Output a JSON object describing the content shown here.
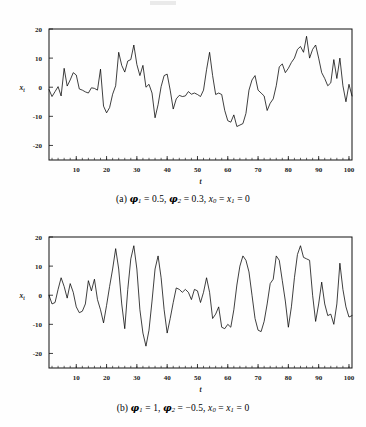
{
  "page": {
    "background_color": "#fefefe",
    "ink_color": "#000000"
  },
  "figures": [
    {
      "id": "a",
      "caption_prefix": "(a)",
      "caption_plain": "(a) φ₁ = 0.5, φ₂ = 0.3, x₀ = x₁ = 0",
      "caption_parts": {
        "label": "(a)",
        "phi1_symbol": "φ",
        "phi1_sub": "1",
        "phi1_eq": "= 0.5,",
        "phi2_symbol": "φ",
        "phi2_sub": "2",
        "phi2_eq": "= 0.3,",
        "x0_symbol": "x",
        "x0_sub": "0",
        "x_eq_mid": "=",
        "x1_symbol": "x",
        "x1_sub": "1",
        "x1_eq": "= 0"
      }
    },
    {
      "id": "b",
      "caption_prefix": "(b)",
      "caption_plain": "(b) φ₁ = 1, φ₂ = −0.5, x₀ = x₁ = 0",
      "caption_parts": {
        "label": "(b)",
        "phi1_symbol": "φ",
        "phi1_sub": "1",
        "phi1_eq": "= 1,",
        "phi2_symbol": "φ",
        "phi2_sub": "2",
        "phi2_eq": "= −0.5,",
        "x0_symbol": "x",
        "x0_sub": "0",
        "x_eq_mid": "=",
        "x1_symbol": "x",
        "x1_sub": "1",
        "x1_eq": "= 0"
      }
    }
  ],
  "chart_data": [
    {
      "type": "line",
      "id": "chart-a",
      "title": "",
      "xlabel": "t",
      "ylabel": "x_t",
      "ylabel_base": "x",
      "ylabel_sub": "t",
      "xlim": [
        1,
        101
      ],
      "ylim": [
        -25,
        20
      ],
      "yticks": [
        20,
        10,
        0,
        -10,
        -20
      ],
      "ytick_labels": [
        "20",
        "10",
        "0",
        "-10",
        "-20"
      ],
      "xticks": [
        10,
        20,
        30,
        40,
        50,
        60,
        70,
        80,
        90,
        100
      ],
      "xtick_labels": [
        "10",
        "20",
        "30",
        "40",
        "50",
        "60",
        "70",
        "80",
        "90",
        "100"
      ],
      "grid": false,
      "legend": "none",
      "line_color": "#000000",
      "x": [
        1,
        2,
        3,
        4,
        5,
        6,
        7,
        8,
        9,
        10,
        11,
        12,
        13,
        14,
        15,
        16,
        17,
        18,
        19,
        20,
        21,
        22,
        23,
        24,
        25,
        26,
        27,
        28,
        29,
        30,
        31,
        32,
        33,
        34,
        35,
        36,
        37,
        38,
        39,
        40,
        41,
        42,
        43,
        44,
        45,
        46,
        47,
        48,
        49,
        50,
        51,
        52,
        53,
        54,
        55,
        56,
        57,
        58,
        59,
        60,
        61,
        62,
        63,
        64,
        65,
        66,
        67,
        68,
        69,
        70,
        71,
        72,
        73,
        74,
        75,
        76,
        77,
        78,
        79,
        80,
        81,
        82,
        83,
        84,
        85,
        86,
        87,
        88,
        89,
        90,
        91,
        92,
        93,
        94,
        95,
        96,
        97,
        98,
        99,
        100,
        101
      ],
      "values": [
        -0.8,
        -3.2,
        -1.5,
        0.2,
        -3.0,
        6.5,
        0.4,
        2.5,
        5.0,
        4.2,
        -0.6,
        -1.0,
        -1.6,
        -2.0,
        -0.2,
        -0.4,
        -1.0,
        6.2,
        -6.5,
        -8.8,
        -7.0,
        -2.4,
        0.5,
        12.0,
        7.5,
        5.2,
        9.0,
        9.5,
        14.5,
        7.8,
        4.0,
        7.5,
        0.0,
        1.0,
        -2.0,
        -10.5,
        -6.0,
        0.2,
        4.0,
        4.5,
        -1.0,
        -7.5,
        -4.0,
        -2.8,
        -3.2,
        -3.0,
        -1.5,
        -2.4,
        -2.0,
        -2.5,
        -3.2,
        -1.0,
        6.0,
        12.0,
        4.0,
        -2.5,
        -2.0,
        -2.5,
        -8.0,
        -11.5,
        -12.0,
        -9.5,
        -13.5,
        -13.0,
        -12.5,
        -9.0,
        -1.0,
        2.5,
        4.0,
        -1.0,
        -2.0,
        -3.0,
        -8.0,
        -5.5,
        -4.0,
        0.5,
        7.0,
        8.0,
        5.0,
        6.5,
        8.5,
        10.0,
        13.0,
        14.0,
        12.0,
        17.5,
        10.0,
        13.0,
        14.5,
        10.0,
        5.0,
        3.0,
        0.5,
        1.5,
        9.5,
        3.0,
        10.0,
        0.5,
        -5.0,
        1.0,
        -3.0
      ]
    },
    {
      "type": "line",
      "id": "chart-b",
      "title": "",
      "xlabel": "t",
      "ylabel": "x_t",
      "ylabel_base": "x",
      "ylabel_sub": "t",
      "xlim": [
        1,
        101
      ],
      "ylim": [
        -25,
        20
      ],
      "yticks": [
        20,
        10,
        0,
        -10,
        -20
      ],
      "ytick_labels": [
        "20",
        "10",
        "0",
        "-10",
        "-20"
      ],
      "xticks": [
        10,
        20,
        30,
        40,
        50,
        60,
        70,
        80,
        90,
        100
      ],
      "xtick_labels": [
        "10",
        "20",
        "30",
        "40",
        "50",
        "60",
        "70",
        "80",
        "90",
        "100"
      ],
      "grid": false,
      "legend": "none",
      "line_color": "#000000",
      "x": [
        1,
        2,
        3,
        4,
        5,
        6,
        7,
        8,
        9,
        10,
        11,
        12,
        13,
        14,
        15,
        16,
        17,
        18,
        19,
        20,
        21,
        22,
        23,
        24,
        25,
        26,
        27,
        28,
        29,
        30,
        31,
        32,
        33,
        34,
        35,
        36,
        37,
        38,
        39,
        40,
        41,
        42,
        43,
        44,
        45,
        46,
        47,
        48,
        49,
        50,
        51,
        52,
        53,
        54,
        55,
        56,
        57,
        58,
        59,
        60,
        61,
        62,
        63,
        64,
        65,
        66,
        67,
        68,
        69,
        70,
        71,
        72,
        73,
        74,
        75,
        76,
        77,
        78,
        79,
        80,
        81,
        82,
        83,
        84,
        85,
        86,
        87,
        88,
        89,
        90,
        91,
        92,
        93,
        94,
        95,
        96,
        97,
        98,
        99,
        100,
        101
      ],
      "values": [
        0.0,
        -3.0,
        -2.5,
        2.0,
        6.0,
        3.0,
        -1.0,
        4.0,
        1.0,
        -4.0,
        -6.0,
        -5.5,
        -3.0,
        5.0,
        1.5,
        5.5,
        -1.5,
        -5.0,
        -9.5,
        -3.5,
        3.0,
        9.0,
        16.0,
        9.0,
        -3.0,
        -11.5,
        2.0,
        12.5,
        17.0,
        9.0,
        -5.0,
        -13.0,
        -17.5,
        -12.0,
        -2.0,
        9.0,
        13.5,
        6.0,
        -5.0,
        -13.0,
        -8.0,
        -2.5,
        2.5,
        2.0,
        1.0,
        2.0,
        1.0,
        -1.5,
        2.0,
        1.5,
        -2.5,
        1.0,
        6.0,
        1.0,
        -8.0,
        -6.5,
        -4.0,
        -11.0,
        -11.5,
        -10.0,
        -11.0,
        -5.0,
        3.5,
        10.0,
        13.5,
        12.0,
        8.0,
        0.0,
        -8.0,
        -12.0,
        -12.5,
        -9.0,
        -3.0,
        4.0,
        5.5,
        13.5,
        12.0,
        5.0,
        -2.0,
        -11.0,
        -4.0,
        6.0,
        14.0,
        17.0,
        13.0,
        12.5,
        12.0,
        0.0,
        -9.0,
        -3.0,
        4.5,
        -3.0,
        -7.0,
        -6.5,
        -10.0,
        -3.0,
        11.0,
        2.0,
        -4.0,
        -7.5,
        -7.0
      ]
    }
  ]
}
